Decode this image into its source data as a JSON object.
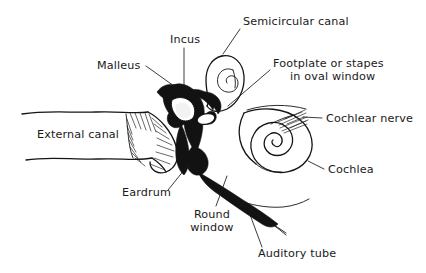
{
  "diagram": {
    "style": "hand-drawn line illustration, black ink on white",
    "canvas": {
      "width": 426,
      "height": 273
    },
    "colors": {
      "background": "#ffffff",
      "ink": "#151515",
      "label_text": "#1a1a1a",
      "leader_line": "#1a1a1a"
    },
    "labels": [
      {
        "id": "semicircular-canal",
        "text": "Semicircular canal",
        "lines": [
          "Semicircular canal"
        ],
        "x": 243,
        "y": 25,
        "anchor": "start",
        "leader": "M 240 29 L 223 54"
      },
      {
        "id": "incus",
        "text": "Incus",
        "lines": [
          "Incus"
        ],
        "x": 170,
        "y": 43,
        "anchor": "start",
        "leader": "M 184 48 L 184 86"
      },
      {
        "id": "malleus",
        "text": "Malleus",
        "lines": [
          "Malleus"
        ],
        "x": 97,
        "y": 69,
        "anchor": "start",
        "leader": "M 146 66 L 174 86"
      },
      {
        "id": "footplate-stapes",
        "text": "Footplate or stapes in oval window",
        "lines": [
          "Footplate or stapes",
          "in oval window"
        ],
        "x": 273,
        "y": 67,
        "anchor": "start",
        "leader": "M 270 70 L 228 106"
      },
      {
        "id": "cochlear-nerve",
        "text": "Cochlear nerve",
        "lines": [
          "Cochlear nerve"
        ],
        "x": 326,
        "y": 122,
        "anchor": "start",
        "leader": "M 322 118 L 303 117"
      },
      {
        "id": "external-canal",
        "text": "External canal",
        "lines": [
          "External canal"
        ],
        "x": 37,
        "y": 138,
        "anchor": "start",
        "leader": ""
      },
      {
        "id": "cochlea",
        "text": "Cochlea",
        "lines": [
          "Cochlea"
        ],
        "x": 328,
        "y": 173,
        "anchor": "start",
        "leader": "M 324 169 L 308 161"
      },
      {
        "id": "eardrum",
        "text": "Eardrum",
        "lines": [
          "Eardrum"
        ],
        "x": 122,
        "y": 196,
        "anchor": "start",
        "leader": "M 168 190 L 189 164"
      },
      {
        "id": "round-window",
        "text": "Round window",
        "lines": [
          "Round",
          "window"
        ],
        "x": 212,
        "y": 218,
        "anchor": "middle",
        "leader": "M 216 206 L 227 176"
      },
      {
        "id": "auditory-tube",
        "text": "Auditory tube",
        "lines": [
          "Auditory tube"
        ],
        "x": 258,
        "y": 257,
        "anchor": "start",
        "leader": "M 262 247 L 249 212"
      }
    ],
    "structures": [
      {
        "id": "external-auditory-canal",
        "name": "External canal tube"
      },
      {
        "id": "tympanic-membrane",
        "name": "Eardrum membrane"
      },
      {
        "id": "ossicles",
        "name": "Malleus, incus and stapes ossicle chain"
      },
      {
        "id": "semicircular-canal-loop",
        "name": "Semicircular canal loop"
      },
      {
        "id": "cochlea-spiral",
        "name": "Cochlea spiral"
      },
      {
        "id": "cochlear-nerve-fibers",
        "name": "Cochlear nerve fiber bundle"
      },
      {
        "id": "eustachian-tube",
        "name": "Auditory (eustachian) tube"
      }
    ]
  }
}
